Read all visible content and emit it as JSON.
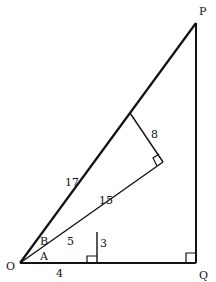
{
  "diagram": {
    "title_cutoff": "",
    "points": {
      "O": {
        "label": "O",
        "x": 20,
        "y": 263
      },
      "Q": {
        "label": "Q",
        "x": 196,
        "y": 263
      },
      "P": {
        "label": "P",
        "x": 196,
        "y": 23
      },
      "foot3": {
        "x": 97,
        "y": 263
      },
      "top3": {
        "x": 97,
        "y": 232
      },
      "corner8": {
        "x": 163,
        "y": 162
      },
      "top8": {
        "x": 130,
        "y": 113
      }
    },
    "angle_labels": {
      "A": "A",
      "B": "B"
    },
    "lengths": {
      "OP": "17",
      "segment_15": "15",
      "segment_8": "8",
      "segment_5": "5",
      "segment_3": "3",
      "segment_4": "4"
    },
    "colors": {
      "line": "#111111",
      "background": "#ffffff"
    }
  }
}
